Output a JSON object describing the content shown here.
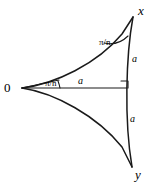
{
  "figure": {
    "type": "geometry-diagram",
    "stroke_color": "#1a1a1a",
    "background_color": "#ffffff",
    "vertices": [
      {
        "id": "origin",
        "label": "0",
        "x": 22,
        "y": 88
      },
      {
        "id": "x",
        "label": "x",
        "x": 133,
        "y": 17
      },
      {
        "id": "y",
        "label": "y",
        "x": 132,
        "y": 167
      }
    ],
    "angles": [
      {
        "id": "angle-at-origin",
        "label": "π/n",
        "numerator": "π",
        "denominator": "n",
        "at_vertex": "origin"
      },
      {
        "id": "angle-at-x",
        "label": "π/n",
        "numerator": "π",
        "denominator": "n",
        "at_vertex": "x"
      }
    ],
    "sides": [
      {
        "id": "segment-midline",
        "label": "a",
        "from": "origin",
        "to": "foot",
        "kind": "straight"
      },
      {
        "id": "arc-upper-right",
        "label": "a",
        "from": "x",
        "to": "foot",
        "kind": "arc"
      },
      {
        "id": "arc-lower-right",
        "label": "a",
        "from": "foot",
        "to": "y",
        "kind": "arc"
      }
    ],
    "markers": [
      {
        "id": "right-angle",
        "label": "right-angle-marker",
        "x": 122,
        "y": 82
      }
    ],
    "arcs": [
      {
        "id": "arc-origin-to-x",
        "from": "origin",
        "to": "x",
        "curvature": "concave-up"
      },
      {
        "id": "arc-origin-to-y",
        "from": "origin",
        "to": "y",
        "curvature": "concave-down"
      },
      {
        "id": "arc-x-to-y",
        "from": "x",
        "to": "y",
        "curvature": "concave-left"
      }
    ]
  }
}
